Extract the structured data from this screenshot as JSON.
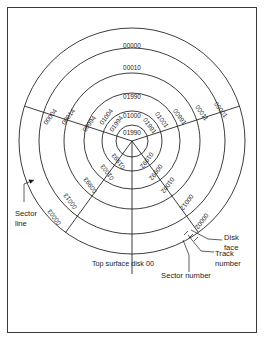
{
  "figure": {
    "caption": "Top surface disk 00",
    "geometry": {
      "center_x": 124,
      "center_y": 133,
      "ring_radii": [
        16,
        30,
        48,
        68,
        93,
        113
      ],
      "sector_count": 5,
      "sector_boundary_angles_deg": [
        -90,
        -18,
        54,
        126,
        198
      ]
    },
    "annotations": [
      {
        "name": "sector-line",
        "lines": [
          "Sector",
          "line"
        ]
      },
      {
        "name": "disk-face",
        "lines": [
          "Disk",
          "face"
        ]
      },
      {
        "name": "track-number",
        "lines": [
          "Track",
          "number"
        ]
      },
      {
        "name": "sector-number",
        "lines": [
          "Sector number"
        ]
      }
    ],
    "sectors": [
      {
        "id": "sector-0",
        "name": "top-sector",
        "orientation": "upright",
        "labels": [
          "01990",
          "01000",
          "01990",
          "00010",
          "00000"
        ]
      },
      {
        "id": "sector-4",
        "name": "upper-left-sector",
        "orientation": "rotated",
        "labels": [
          "01994",
          "01004",
          "00994",
          "00014",
          "00004"
        ]
      },
      {
        "id": "sector-1",
        "name": "upper-right-sector",
        "orientation": "rotated",
        "labels": [
          "01991",
          "01001",
          "00991",
          "00011",
          "00001"
        ]
      },
      {
        "id": "sector-3",
        "name": "lower-left-sector",
        "orientation": "rotated",
        "labels": [
          "01993",
          "01003",
          "00993",
          "00013",
          "00003"
        ]
      },
      {
        "id": "sector-2",
        "name": "lower-right-sector",
        "orientation": "rotated",
        "labels": [
          "01992",
          "00992",
          "01002",
          "00012",
          "00002"
        ]
      }
    ],
    "colors": {
      "line": "#1a1a1a",
      "text": "#1a1a1a",
      "frame": "#3a3a3a",
      "background": "#ffffff"
    }
  }
}
